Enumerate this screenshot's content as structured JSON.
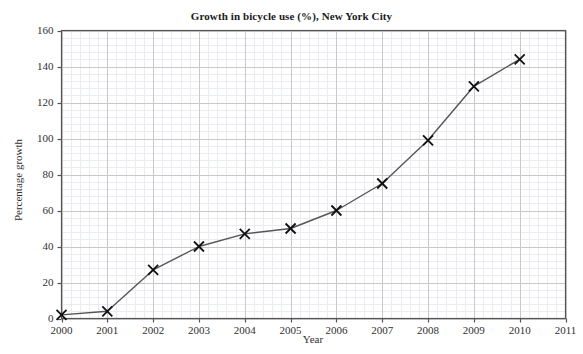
{
  "chart_data": {
    "type": "line",
    "title": "Growth in bicycle use (%), New York City",
    "xlabel": "Year",
    "ylabel": "Percentage growth",
    "x": [
      2000,
      2001,
      2002,
      2003,
      2004,
      2005,
      2006,
      2007,
      2008,
      2009,
      2010
    ],
    "values": [
      2,
      4,
      27,
      40,
      47,
      50,
      60,
      75,
      99,
      129,
      144
    ],
    "series": [
      {
        "name": "Percentage growth",
        "values": [
          2,
          4,
          27,
          40,
          47,
          50,
          60,
          75,
          99,
          129,
          144
        ]
      }
    ],
    "xlim": [
      2000,
      2011
    ],
    "ylim": [
      0,
      160
    ],
    "x_ticks": [
      2000,
      2001,
      2002,
      2003,
      2004,
      2005,
      2006,
      2007,
      2008,
      2009,
      2010,
      2011
    ],
    "x_tick_labels": [
      "2000",
      "2001",
      "2002",
      "2003",
      "2004",
      "2005",
      "2006",
      "2007",
      "2008",
      "2009",
      "2010",
      "2011"
    ],
    "y_ticks": [
      0,
      20,
      40,
      60,
      80,
      100,
      120,
      140,
      160
    ],
    "y_tick_labels": [
      "0",
      "20",
      "40",
      "60",
      "80",
      "100",
      "120",
      "140",
      "160"
    ],
    "grid": true,
    "minor_grid": true,
    "legend": false,
    "marker": "x",
    "line_color": "#555555",
    "marker_color": "#111111",
    "grid_color": "#c8c8c8",
    "minor_grid_color": "#ebebf2",
    "axis_color": "#555555",
    "background_color": "#ffffff"
  }
}
